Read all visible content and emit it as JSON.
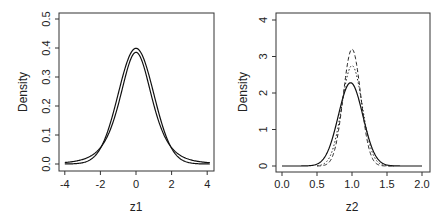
{
  "chart_data": [
    {
      "type": "line",
      "title": "",
      "xlabel": "z1",
      "ylabel": "Density",
      "xlim": [
        -4.2,
        4.2
      ],
      "ylim": [
        0,
        0.5
      ],
      "xticks": [
        "-4",
        "-2",
        "0",
        "2",
        "4"
      ],
      "yticks": [
        "0.0",
        "0.1",
        "0.2",
        "0.3",
        "0.4",
        "0.5"
      ],
      "grid": false,
      "series": [
        {
          "name": "curve A (solid)",
          "style": "solid",
          "distribution": "normal",
          "mean": 0,
          "sd": 1.0,
          "peak": 0.4
        },
        {
          "name": "curve B (solid, heavier tails)",
          "style": "solid",
          "distribution": "t-like",
          "mean": 0,
          "peak": 0.385
        }
      ]
    },
    {
      "type": "line",
      "title": "",
      "xlabel": "z2",
      "ylabel": "Density",
      "xlim": [
        0.0,
        2.0
      ],
      "ylim": [
        0,
        4
      ],
      "xticks": [
        "0.0",
        "0.5",
        "1.0",
        "1.5",
        "2.0"
      ],
      "yticks": [
        "0",
        "1",
        "2",
        "3",
        "4"
      ],
      "grid": false,
      "series": [
        {
          "name": "solid",
          "style": "solid",
          "mean": 0.98,
          "peak": 2.28
        },
        {
          "name": "dotted",
          "style": "dotted",
          "mean": 1.0,
          "peak": 2.75
        },
        {
          "name": "dashed",
          "style": "dashed",
          "mean": 1.0,
          "peak": 3.2
        }
      ]
    }
  ],
  "labels": {
    "left_x": "z1",
    "left_y": "Density",
    "right_x": "z2",
    "right_y": "Density"
  },
  "ticks": {
    "left_x": [
      "-4",
      "-2",
      "0",
      "2",
      "4"
    ],
    "left_y": [
      "0.0",
      "0.1",
      "0.2",
      "0.3",
      "0.4",
      "0.5"
    ],
    "right_x": [
      "0.0",
      "0.5",
      "1.0",
      "1.5",
      "2.0"
    ],
    "right_y": [
      "0",
      "1",
      "2",
      "3",
      "4"
    ]
  }
}
